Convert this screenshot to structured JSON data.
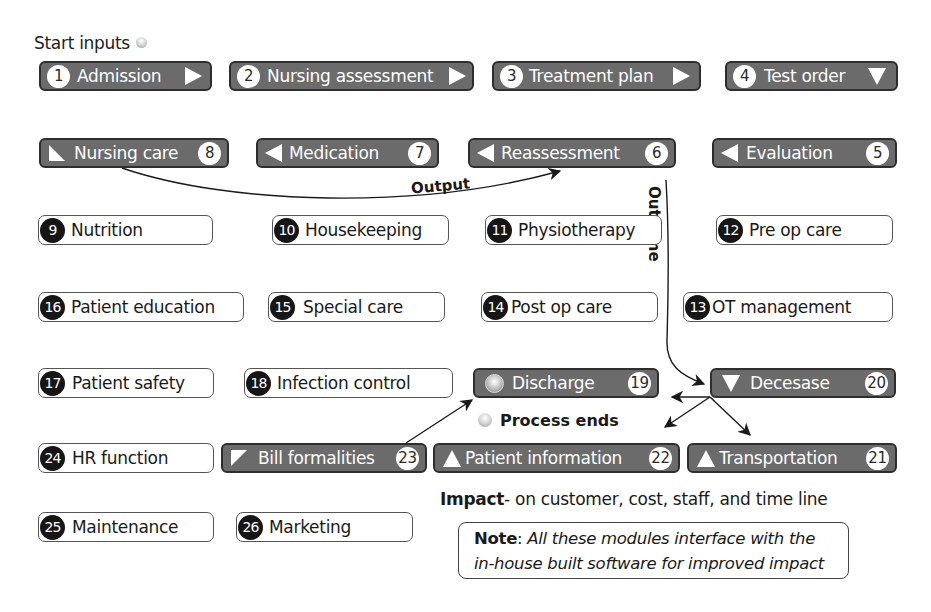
{
  "start": {
    "label": "Start inputs",
    "icon": "orb-icon"
  },
  "modules": [
    {
      "num": "1",
      "label": "Admission",
      "style": "dark",
      "arrow": "right"
    },
    {
      "num": "2",
      "label": "Nursing assessment",
      "style": "dark",
      "arrow": "right"
    },
    {
      "num": "3",
      "label": "Treatment plan",
      "style": "dark",
      "arrow": "right"
    },
    {
      "num": "4",
      "label": "Test order",
      "style": "dark",
      "arrow": "down"
    },
    {
      "num": "5",
      "label": "Evaluation",
      "style": "dark",
      "arrow": "left"
    },
    {
      "num": "6",
      "label": "Reassessment",
      "style": "dark",
      "arrow": "left"
    },
    {
      "num": "7",
      "label": "Medication",
      "style": "dark",
      "arrow": "left"
    },
    {
      "num": "8",
      "label": "Nursing care",
      "style": "dark",
      "arrow": "corner"
    },
    {
      "num": "9",
      "label": "Nutrition",
      "style": "light"
    },
    {
      "num": "10",
      "label": "Housekeeping",
      "style": "light"
    },
    {
      "num": "11",
      "label": "Physiotherapy",
      "style": "light"
    },
    {
      "num": "12",
      "label": "Pre op care",
      "style": "light"
    },
    {
      "num": "13",
      "label": "OT management",
      "style": "light"
    },
    {
      "num": "14",
      "label": "Post op care",
      "style": "light"
    },
    {
      "num": "15",
      "label": "Special care",
      "style": "light"
    },
    {
      "num": "16",
      "label": "Patient education",
      "style": "light"
    },
    {
      "num": "17",
      "label": "Patient safety",
      "style": "light"
    },
    {
      "num": "18",
      "label": "Infection control",
      "style": "light"
    },
    {
      "num": "19",
      "label": "Discharge",
      "style": "dark",
      "arrow": "orb"
    },
    {
      "num": "20",
      "label": "Decesase",
      "style": "dark",
      "arrow": "down"
    },
    {
      "num": "21",
      "label": "Transportation",
      "style": "dark",
      "arrow": "up"
    },
    {
      "num": "22",
      "label": "Patient information",
      "style": "dark",
      "arrow": "up"
    },
    {
      "num": "23",
      "label": "Bill formalities",
      "style": "dark",
      "arrow": "corner"
    },
    {
      "num": "24",
      "label": "HR function",
      "style": "light"
    },
    {
      "num": "25",
      "label": "Maintenance",
      "style": "light"
    },
    {
      "num": "26",
      "label": "Marketing",
      "style": "light"
    }
  ],
  "connectors": {
    "output_label": "Output",
    "outcome_label": "Outcome",
    "process_ends": "Process ends"
  },
  "impact": {
    "bold": "Impact",
    "rest": "- on customer, cost, staff, and time line"
  },
  "note": {
    "bold": "Note",
    "colon": ": ",
    "line1": "All these modules interface with the",
    "line2": "in-house built software for improved impact"
  },
  "colors": {
    "dark_box": "#6b6b6b",
    "dark_border": "#2e2e2e",
    "light_num": "#161616"
  }
}
